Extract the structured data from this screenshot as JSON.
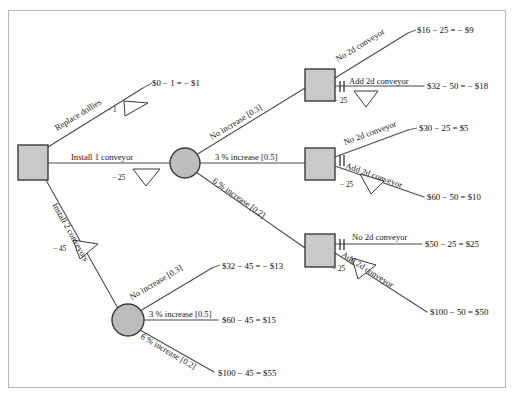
{
  "diagram": {
    "type": "decision-tree",
    "colors": {
      "node_fill": "#c9c9c9",
      "chance_fill": "#bdbdbd",
      "edge": "#4a4a4a",
      "frame": "#b9b9b9",
      "background": "#fdfdfc",
      "text": "#1b1b1b"
    }
  },
  "nodes": {
    "root": {
      "name": "root-decision",
      "shape": "square"
    },
    "chance_upper": {
      "name": "chance-1-conveyor",
      "shape": "circle"
    },
    "chance_lower": {
      "name": "chance-2-conveyors",
      "shape": "circle"
    },
    "decision_top": {
      "name": "decision-no-increase",
      "shape": "square"
    },
    "decision_mid": {
      "name": "decision-3pct-increase",
      "shape": "square"
    },
    "decision_bot": {
      "name": "decision-6pct-increase",
      "shape": "square"
    }
  },
  "branches": {
    "replace_dollies": "Replace dollies",
    "install_1_conveyor": "Install 1 conveyor",
    "install_2_conveyors": "Install 2 conveyors",
    "no_increase_upper": "No increase [0.3]",
    "three_pct_upper": "3 % increase [0.5]",
    "six_pct_upper": "6 % increase [0.2]",
    "no_increase_lower": "No increase [0.3]",
    "three_pct_lower": "3 % increase [0.5]",
    "six_pct_lower": "6 % increase [0.2]",
    "no_2d_top": "No 2d conveyor",
    "add_2d_top": "Add 2d conveyor",
    "no_2d_mid": "No 2d conveyor",
    "add_2d_mid": "Add 2d conveyor",
    "no_2d_bot": "No 2d conveyor",
    "add_2d_bot": "Add 2d conveyor"
  },
  "costs": {
    "replace_dollies": "− 1",
    "install_1_conveyor": "− 25",
    "install_2_conveyors": "− 45",
    "add_2d_top": "− 25",
    "add_2d_mid": "− 25",
    "add_2d_bot": "− 25"
  },
  "outcomes": {
    "replace_dollies": "$0 − 1 = − $1",
    "no_2d_top": "$16 − 25 = − $9",
    "add_2d_top": "$32 − 50 = − $18",
    "no_2d_mid": "$30 − 25 = $5",
    "add_2d_mid": "$60 − 50 = $10",
    "no_2d_bot": "$50 − 25 = $25",
    "add_2d_bot": "$100 − 50 = $50",
    "no_increase_lower": "$32 − 45 = − $13",
    "three_pct_lower": "$60 − 45 = $15",
    "six_pct_lower": "$100 − 45 = $55"
  }
}
